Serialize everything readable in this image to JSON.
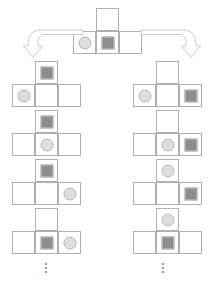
{
  "diagram": {
    "colors": {
      "cell_border": "#b0b0b0",
      "square_fill": "#8d8d8d",
      "circle_fill": "#dedede",
      "arrow_stroke": "#c9c9c9",
      "ellipsis": "#c4736f"
    },
    "ellipsis_glyph": "⋮",
    "root": {
      "label": "root-state",
      "x": 73,
      "y": 8,
      "cells": {
        "top": "empty",
        "bottom_left": "circle",
        "bottom_middle": "square",
        "bottom_right": "empty"
      }
    },
    "arrows": [
      {
        "label": "branch-left-arrow",
        "direction": "down-left",
        "x": 22,
        "y": 26
      },
      {
        "label": "branch-right-arrow",
        "direction": "down-right",
        "x": 140,
        "y": 26
      }
    ],
    "columns": [
      {
        "name": "left-branch",
        "ellipsis_x": 40,
        "ellipsis_y": 262,
        "states": [
          {
            "label": "left-step-1",
            "x": 12,
            "y": 61,
            "cells": {
              "top": "square",
              "bottom_left": "circle",
              "bottom_middle": "empty",
              "bottom_right": "empty"
            }
          },
          {
            "label": "left-step-2",
            "x": 12,
            "y": 110,
            "cells": {
              "top": "square",
              "bottom_left": "empty",
              "bottom_middle": "circle",
              "bottom_right": "empty"
            }
          },
          {
            "label": "left-step-3",
            "x": 12,
            "y": 159,
            "cells": {
              "top": "square",
              "bottom_left": "empty",
              "bottom_middle": "empty",
              "bottom_right": "circle"
            }
          },
          {
            "label": "left-step-4",
            "x": 12,
            "y": 208,
            "cells": {
              "top": "empty",
              "bottom_left": "empty",
              "bottom_middle": "square",
              "bottom_right": "circle"
            }
          }
        ]
      },
      {
        "name": "right-branch",
        "ellipsis_x": 157,
        "ellipsis_y": 262,
        "states": [
          {
            "label": "right-step-1",
            "x": 133,
            "y": 61,
            "cells": {
              "top": "empty",
              "bottom_left": "circle",
              "bottom_middle": "empty",
              "bottom_right": "square"
            }
          },
          {
            "label": "right-step-2",
            "x": 133,
            "y": 110,
            "cells": {
              "top": "empty",
              "bottom_left": "empty",
              "bottom_middle": "circle",
              "bottom_right": "square"
            }
          },
          {
            "label": "right-step-3",
            "x": 133,
            "y": 159,
            "cells": {
              "top": "circle",
              "bottom_left": "empty",
              "bottom_middle": "empty",
              "bottom_right": "square"
            }
          },
          {
            "label": "right-step-4",
            "x": 133,
            "y": 208,
            "cells": {
              "top": "circle",
              "bottom_left": "empty",
              "bottom_middle": "square",
              "bottom_right": "empty"
            }
          }
        ]
      }
    ]
  }
}
